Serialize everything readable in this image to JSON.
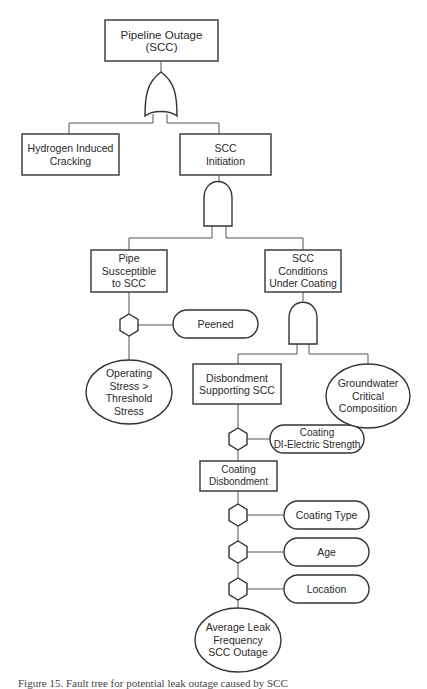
{
  "diagram": {
    "type": "fault-tree",
    "nodes": {
      "top": {
        "label": "Pipeline Outage\n(SCC)",
        "shape": "rectangle"
      },
      "hydrogen": {
        "label": "Hydrogen Induced\nCracking",
        "shape": "rectangle"
      },
      "scc_initiation": {
        "label": "SCC\nInitiation",
        "shape": "rectangle"
      },
      "pipe_susceptible": {
        "label": "Pipe\nSusceptible\nto SCC",
        "shape": "rectangle"
      },
      "scc_conditions": {
        "label": "SCC\nConditions\nUnder Coating",
        "shape": "rectangle"
      },
      "peened": {
        "label": "Peened",
        "shape": "rounded"
      },
      "operating_stress": {
        "label": "Operating\nStress >\nThreshold\nStress",
        "shape": "ellipse"
      },
      "disbondment_supporting": {
        "label": "Disbondment\nSupporting SCC",
        "shape": "rectangle"
      },
      "groundwater": {
        "label": "Groundwater\nCritical\nComposition",
        "shape": "ellipse"
      },
      "coating_dielectric": {
        "label": "Coating\nDI-Electric Strength",
        "shape": "rounded"
      },
      "coating_disbondment": {
        "label": "Coating\nDisbondment",
        "shape": "rectangle"
      },
      "coating_type": {
        "label": "Coating Type",
        "shape": "rounded"
      },
      "age": {
        "label": "Age",
        "shape": "rounded"
      },
      "location": {
        "label": "Location",
        "shape": "rounded"
      },
      "avg_leak": {
        "label": "Average Leak\nFrequency\nSCC Outage",
        "shape": "ellipse"
      }
    },
    "gates": [
      {
        "id": "or-gate-top",
        "type": "OR",
        "inputs": [
          "hydrogen",
          "scc_initiation"
        ],
        "output": "top"
      },
      {
        "id": "and-gate-initiation",
        "type": "AND",
        "inputs": [
          "pipe_susceptible",
          "scc_conditions"
        ],
        "output": "scc_initiation"
      },
      {
        "id": "and-gate-conditions",
        "type": "AND",
        "inputs": [
          "disbondment_supporting",
          "groundwater"
        ],
        "output": "scc_conditions"
      },
      {
        "id": "inhibit-peened",
        "type": "INHIBIT",
        "condition": "peened"
      },
      {
        "id": "inhibit-dielectric",
        "type": "INHIBIT",
        "condition": "coating_dielectric"
      },
      {
        "id": "inhibit-coating-type",
        "type": "INHIBIT",
        "condition": "coating_type"
      },
      {
        "id": "inhibit-age",
        "type": "INHIBIT",
        "condition": "age"
      },
      {
        "id": "inhibit-location",
        "type": "INHIBIT",
        "condition": "location"
      }
    ]
  },
  "caption": "Figure 15. Fault tree for potential leak outage caused by SCC"
}
